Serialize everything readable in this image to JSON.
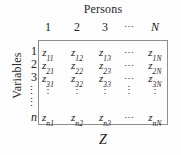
{
  "figure": {
    "caption_below": "Z",
    "border_color": "#8e8e8e",
    "background_color": "#fdfdfd",
    "text_color": "#1a1a1a"
  },
  "columns_dimension": {
    "title": "Persons",
    "labels": [
      "1",
      "2",
      "3",
      "⋯",
      "N"
    ],
    "index_symbol": "N"
  },
  "rows_dimension": {
    "title": "Variables",
    "labels": [
      "1",
      "2",
      "3",
      "⋮",
      "⋮",
      "n"
    ],
    "index_symbol": "n"
  },
  "matrix": {
    "symbol": "Z",
    "entry_base": "z",
    "rows": [
      {
        "cells": [
          {
            "base": "z",
            "sub": "11"
          },
          {
            "base": "z",
            "sub": "12"
          },
          {
            "base": "z",
            "sub": "13"
          },
          {
            "dots": "⋯"
          },
          {
            "base": "z",
            "sub": "1N"
          }
        ]
      },
      {
        "cells": [
          {
            "base": "z",
            "sub": "21"
          },
          {
            "base": "z",
            "sub": "22"
          },
          {
            "base": "z",
            "sub": "23"
          },
          {
            "dots": "⋯"
          },
          {
            "base": "z",
            "sub": "2N"
          }
        ]
      },
      {
        "cells": [
          {
            "base": "z",
            "sub": "31"
          },
          {
            "base": "z",
            "sub": "32"
          },
          {
            "base": "z",
            "sub": "33"
          },
          {
            "dots": "⋯"
          },
          {
            "base": "z",
            "sub": "3N"
          }
        ]
      },
      {
        "cells": [
          {
            "dots": "⋮"
          },
          {
            "dots": "⋮"
          },
          {
            "dots": "⋮"
          },
          {
            "dots": "⋮"
          },
          {
            "dots": "⋮"
          }
        ]
      },
      {
        "cells": [
          {
            "base": "z",
            "sub": "n1"
          },
          {
            "base": "z",
            "sub": "n2"
          },
          {
            "base": "z",
            "sub": "n3"
          },
          {
            "dots": "⋯"
          },
          {
            "base": "z",
            "sub": "nN"
          }
        ]
      }
    ]
  }
}
